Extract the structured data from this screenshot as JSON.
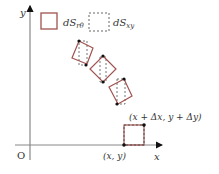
{
  "diagram": {
    "axes": {
      "x_label": "x",
      "y_label": "y",
      "origin_label": "O"
    },
    "legend": [
      {
        "style": "solid",
        "label_main": "dS",
        "label_sub": "rθ"
      },
      {
        "style": "dashed",
        "label_main": "dS",
        "label_sub": "xy"
      }
    ],
    "point_labels": {
      "start": "(x, y)",
      "end": "(x + Δx, y + Δy)"
    },
    "colors": {
      "element": "#a0524f",
      "dashed": "#666666",
      "axis": "#888888",
      "dot": "#111111"
    }
  }
}
